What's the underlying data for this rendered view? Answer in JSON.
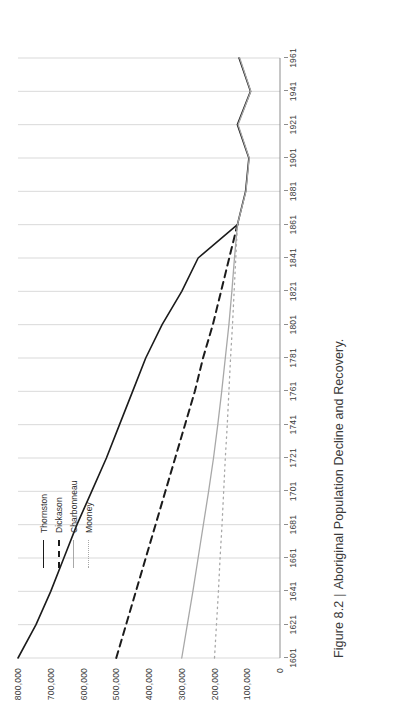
{
  "caption": {
    "figure_number": "Figure 8.2",
    "separator": "|",
    "title": "Aboriginal Population Decline and Recovery."
  },
  "legend": {
    "position": "upper-left-inside",
    "items": [
      {
        "label": "Thornston",
        "style": "solid",
        "color": "#1b1b1b",
        "swatch": "sw-solid-black"
      },
      {
        "label": "Dickason",
        "style": "dashed",
        "color": "#1b1b1b",
        "swatch": "sw-dashed-black"
      },
      {
        "label": "Charbonneau",
        "style": "solid",
        "color": "#a8a8a8",
        "swatch": "sw-solid-gray"
      },
      {
        "label": "Mooney",
        "style": "dotted",
        "color": "#a8a8a8",
        "swatch": "sw-dotted-gray"
      }
    ]
  },
  "chart_data": {
    "type": "line",
    "title": "Aboriginal Population Decline and Recovery.",
    "xlabel": "",
    "ylabel": "",
    "grid": "vertical-only",
    "legend_position": "upper left",
    "xlim": [
      1601,
      1961
    ],
    "ylim": [
      0,
      800000
    ],
    "x_ticks": [
      1601,
      1621,
      1641,
      1661,
      1681,
      1701,
      1721,
      1741,
      1761,
      1781,
      1801,
      1821,
      1841,
      1861,
      1881,
      1901,
      1921,
      1941,
      1961
    ],
    "y_ticks": [
      0,
      100000,
      200000,
      300000,
      400000,
      500000,
      600000,
      700000,
      800000
    ],
    "y_tick_labels": [
      "0",
      "100,000",
      "200,000",
      "300,000",
      "400,000",
      "500,000",
      "600,000",
      "700,000",
      "800,000"
    ],
    "series": [
      {
        "name": "Thornston",
        "color": "#1b1b1b",
        "style": "solid",
        "x": [
          1601,
          1621,
          1641,
          1661,
          1681,
          1701,
          1721,
          1741,
          1761,
          1781,
          1801,
          1821,
          1841,
          1861,
          1881,
          1901,
          1921,
          1941,
          1961
        ],
        "values": [
          800000,
          745000,
          700000,
          660000,
          620000,
          575000,
          530000,
          490000,
          450000,
          410000,
          360000,
          300000,
          250000,
          130000,
          105000,
          95000,
          130000,
          90000,
          125000
        ]
      },
      {
        "name": "Dickason",
        "color": "#1b1b1b",
        "style": "dashed",
        "x": [
          1601,
          1621,
          1641,
          1661,
          1681,
          1701,
          1721,
          1741,
          1761,
          1781,
          1801,
          1821,
          1841,
          1861
        ],
        "values": [
          500000,
          470000,
          440000,
          410000,
          380000,
          350000,
          320000,
          290000,
          260000,
          235000,
          205000,
          180000,
          155000,
          130000
        ]
      },
      {
        "name": "Charbonneau",
        "color": "#a8a8a8",
        "style": "solid",
        "x": [
          1601,
          1621,
          1641,
          1661,
          1681,
          1701,
          1721,
          1741,
          1761,
          1781,
          1801,
          1821,
          1841,
          1861,
          1881,
          1901,
          1921,
          1941,
          1961
        ],
        "values": [
          300000,
          283000,
          266000,
          250000,
          234000,
          218000,
          203000,
          190000,
          178000,
          167000,
          156000,
          147000,
          139000,
          130000,
          104000,
          94000,
          128000,
          89000,
          123000
        ]
      },
      {
        "name": "Mooney",
        "color": "#a8a8a8",
        "style": "dotted",
        "x": [
          1601,
          1621,
          1641,
          1661,
          1681,
          1701,
          1721,
          1741,
          1761,
          1781,
          1801,
          1821,
          1841,
          1861
        ],
        "values": [
          200000,
          194000,
          188000,
          183000,
          177000,
          172000,
          167000,
          161000,
          156000,
          151000,
          145000,
          140000,
          135000,
          130000
        ]
      }
    ]
  }
}
